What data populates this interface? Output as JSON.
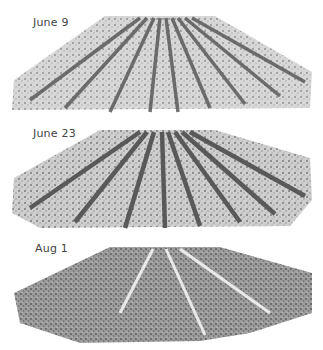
{
  "figure": {
    "panels": [
      {
        "label": "June 9",
        "description": "grayscale 3D reconstruction of crop rows, early stage, sparse vegetation"
      },
      {
        "label": "June 23",
        "description": "grayscale 3D reconstruction of crop rows, mid stage, denser rows"
      },
      {
        "label": "Aug 1",
        "description": "grayscale 3D reconstruction of crop rows, late stage, full canopy"
      }
    ]
  }
}
